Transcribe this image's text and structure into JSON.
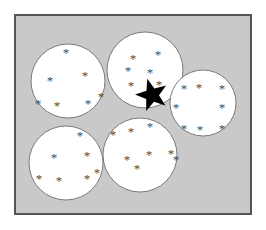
{
  "figure": {
    "type": "diagram",
    "canvas": {
      "width": 266,
      "height": 230
    },
    "colors": {
      "page_background": "#ffffff",
      "panel_background": "#c9c9c9",
      "panel_border": "#555555",
      "circle_fill": "#ffffff",
      "circle_stroke": "#6e6e6e",
      "asterisk_color": "#4a4a4a",
      "star_fill": "#000000"
    },
    "panel": {
      "x": 14,
      "y": 14,
      "width": 238,
      "height": 201,
      "border_width": 2
    },
    "glyphs": {
      "asterisk": "*",
      "asterisk_name": "asterisk-glyph",
      "star": "★",
      "star_name": "filled-star-glyph"
    },
    "counts": {
      "circles": 5,
      "asterisks_total": 36,
      "filled_stars": 1
    },
    "circles": [
      {
        "id": "circle-top-left",
        "label": "top-left cluster",
        "cx": 68,
        "cy": 81,
        "r": 37,
        "asterisk_count": 7,
        "asterisks": [
          {
            "x": 66,
            "y": 52
          },
          {
            "x": 50,
            "y": 80
          },
          {
            "x": 85,
            "y": 75
          },
          {
            "x": 38,
            "y": 103
          },
          {
            "x": 57,
            "y": 105
          },
          {
            "x": 88,
            "y": 103
          },
          {
            "x": 101,
            "y": 96
          }
        ]
      },
      {
        "id": "circle-top-middle",
        "label": "top-middle cluster with highlighted star",
        "cx": 145,
        "cy": 70,
        "r": 38,
        "asterisk_count": 6,
        "asterisks": [
          {
            "x": 133,
            "y": 58
          },
          {
            "x": 158,
            "y": 54
          },
          {
            "x": 128,
            "y": 70
          },
          {
            "x": 150,
            "y": 72
          },
          {
            "x": 131,
            "y": 85
          },
          {
            "x": 159,
            "y": 84
          }
        ]
      },
      {
        "id": "circle-right",
        "label": "right cluster",
        "cx": 203,
        "cy": 103,
        "r": 33,
        "asterisk_count": 8,
        "asterisks": [
          {
            "x": 184,
            "y": 88
          },
          {
            "x": 199,
            "y": 87
          },
          {
            "x": 222,
            "y": 88
          },
          {
            "x": 176,
            "y": 107
          },
          {
            "x": 222,
            "y": 107
          },
          {
            "x": 184,
            "y": 128
          },
          {
            "x": 200,
            "y": 129
          },
          {
            "x": 222,
            "y": 128
          }
        ]
      },
      {
        "id": "circle-bottom-left",
        "label": "bottom-left cluster",
        "cx": 66,
        "cy": 163,
        "r": 37,
        "asterisk_count": 7,
        "asterisks": [
          {
            "x": 80,
            "y": 135
          },
          {
            "x": 54,
            "y": 157
          },
          {
            "x": 87,
            "y": 155
          },
          {
            "x": 39,
            "y": 178
          },
          {
            "x": 59,
            "y": 180
          },
          {
            "x": 87,
            "y": 178
          },
          {
            "x": 97,
            "y": 172
          }
        ]
      },
      {
        "id": "circle-bottom-middle",
        "label": "bottom-middle cluster",
        "cx": 140,
        "cy": 155,
        "r": 37,
        "asterisk_count": 8,
        "asterisks": [
          {
            "x": 150,
            "y": 126
          },
          {
            "x": 131,
            "y": 131
          },
          {
            "x": 113,
            "y": 134
          },
          {
            "x": 149,
            "y": 154
          },
          {
            "x": 171,
            "y": 153
          },
          {
            "x": 127,
            "y": 159
          },
          {
            "x": 137,
            "y": 168
          },
          {
            "x": 176,
            "y": 159
          }
        ]
      }
    ],
    "highlight_star": {
      "id": "highlighted-star",
      "label": "filled black star",
      "cx": 152,
      "cy": 95,
      "outer_r": 17,
      "inner_r": 7,
      "rotation": -16,
      "inside_circle": "circle-top-middle"
    }
  }
}
